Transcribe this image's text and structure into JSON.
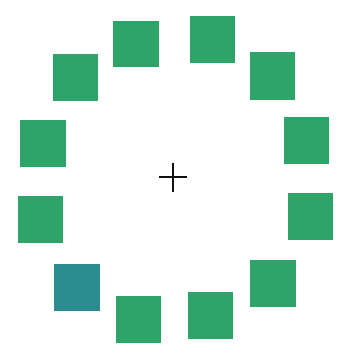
{
  "display": {
    "background": "#ffffff",
    "fixation": {
      "symbol": "+",
      "color": "#111111",
      "center": [
        173,
        177
      ]
    },
    "colors": {
      "standard": "#2ea46a",
      "target": "#2a8c8c"
    },
    "squares": [
      {
        "id": 1,
        "x": 113,
        "y": 21,
        "w": 46,
        "h": 46,
        "role": "standard"
      },
      {
        "id": 2,
        "x": 190,
        "y": 16,
        "w": 45,
        "h": 47,
        "role": "standard"
      },
      {
        "id": 3,
        "x": 250,
        "y": 52,
        "w": 45,
        "h": 48,
        "role": "standard"
      },
      {
        "id": 4,
        "x": 284,
        "y": 117,
        "w": 45,
        "h": 47,
        "role": "standard"
      },
      {
        "id": 5,
        "x": 288,
        "y": 193,
        "w": 45,
        "h": 47,
        "role": "standard"
      },
      {
        "id": 6,
        "x": 250,
        "y": 260,
        "w": 46,
        "h": 47,
        "role": "standard"
      },
      {
        "id": 7,
        "x": 188,
        "y": 292,
        "w": 45,
        "h": 47,
        "role": "standard"
      },
      {
        "id": 8,
        "x": 116,
        "y": 296,
        "w": 45,
        "h": 47,
        "role": "standard"
      },
      {
        "id": 9,
        "x": 54,
        "y": 264,
        "w": 46,
        "h": 47,
        "role": "target"
      },
      {
        "id": 10,
        "x": 18,
        "y": 196,
        "w": 45,
        "h": 47,
        "role": "standard"
      },
      {
        "id": 11,
        "x": 20,
        "y": 120,
        "w": 46,
        "h": 47,
        "role": "standard"
      },
      {
        "id": 12,
        "x": 53,
        "y": 54,
        "w": 45,
        "h": 47,
        "role": "standard"
      }
    ]
  }
}
